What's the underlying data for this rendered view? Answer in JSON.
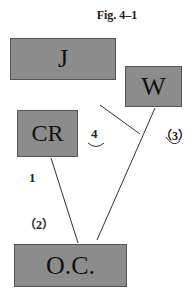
{
  "title": "Fig. 4–1",
  "nodes": {
    "j": {
      "label": "J"
    },
    "w": {
      "label": "W"
    },
    "cr": {
      "label": "CR"
    },
    "oc": {
      "label": "O.C."
    }
  },
  "edge_labels": {
    "one": "1",
    "two": "（2）",
    "three": "（3）",
    "four": "4"
  },
  "edges": [
    {
      "from": "CR",
      "to": "O.C.",
      "label": "1"
    },
    {
      "from": "W",
      "to": "O.C.",
      "label": "(2)"
    },
    {
      "from": "J",
      "to": "W-O.C. line",
      "label": "(3)/4"
    }
  ]
}
